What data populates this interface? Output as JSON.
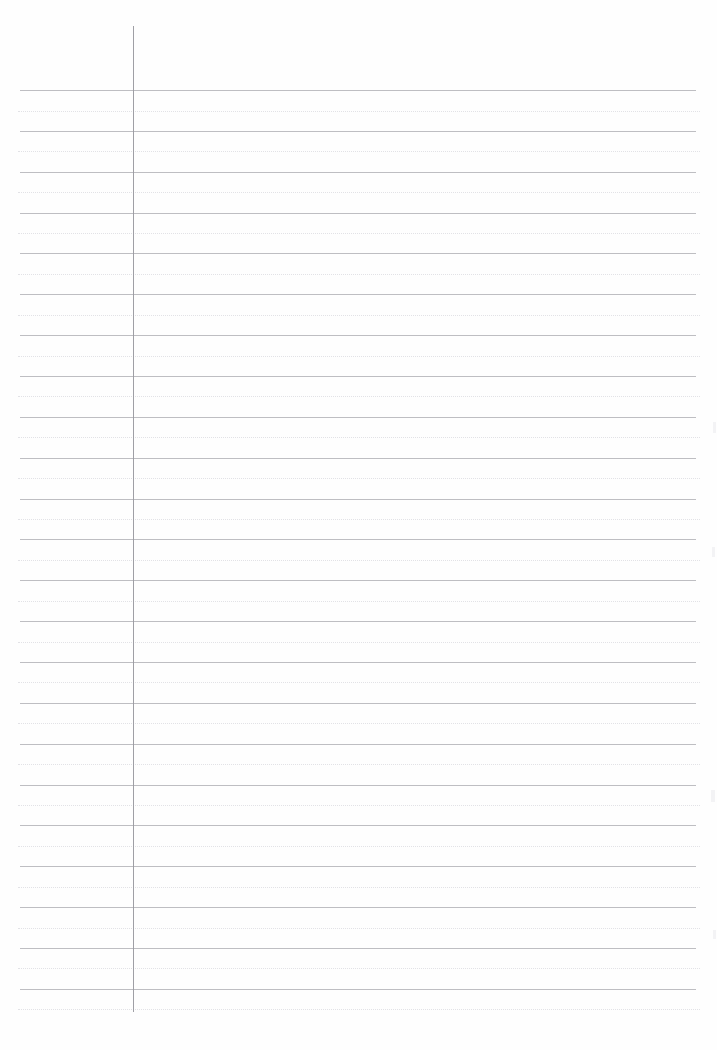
{
  "document": {
    "type": "ruled-notebook-page",
    "title": "Ruled Notebook Page",
    "content_text": "",
    "is_blank": true,
    "page_width": 717,
    "page_height": 1050,
    "background_color": "#ffffff",
    "paper_color": "#fefefe"
  },
  "ruling": {
    "solid_line_color": "#b9b9bd",
    "dotted_line_color": "#d9d9de",
    "margin_line_color": "#9a9aa0",
    "line_left": 20,
    "line_right": 696,
    "dotted_left": 18,
    "dotted_right": 700,
    "first_solid_y": 90,
    "line_spacing": 40.85,
    "solid_line_count": 23,
    "dotted_line_count": 23,
    "solid_lines_y": [
      90,
      130.9,
      171.7,
      212.6,
      253.4,
      294.3,
      335.1,
      376,
      416.8,
      457.7,
      498.5,
      539.4,
      580.2,
      621.1,
      661.9,
      702.8,
      743.6,
      784.5,
      825.3,
      866.2,
      907,
      947.9,
      988.7
    ],
    "dotted_lines_y": [
      110.5,
      151.3,
      192.2,
      233,
      273.9,
      314.7,
      355.6,
      396.4,
      437.3,
      478.1,
      519,
      559.8,
      600.7,
      641.5,
      682.4,
      723.2,
      764.1,
      804.9,
      845.8,
      886.6,
      927.5,
      968.3,
      1009.2
    ]
  },
  "margin": {
    "x": 133,
    "top": 26,
    "bottom": 1012,
    "label": "left-margin-rule"
  },
  "edge_marks": [
    {
      "x": 713,
      "y": 422,
      "w": 3,
      "h": 11
    },
    {
      "x": 712,
      "y": 547,
      "w": 3,
      "h": 10
    },
    {
      "x": 711,
      "y": 790,
      "w": 4,
      "h": 12
    },
    {
      "x": 713,
      "y": 930,
      "w": 3,
      "h": 9
    }
  ]
}
